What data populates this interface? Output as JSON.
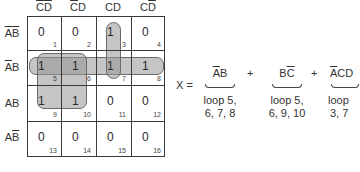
{
  "kmap": {
    "columns": [
      {
        "label": "C̄D̄",
        "overline_parts": [
          "C",
          "D"
        ]
      },
      {
        "label": "C̄D",
        "overline_parts": [
          "C"
        ]
      },
      {
        "label": "CD",
        "overline_parts": []
      },
      {
        "label": "CD̄",
        "overline_parts": [
          "D"
        ]
      }
    ],
    "col_text": [
      {
        "a": "C",
        "b": "D",
        "a_bar": true,
        "b_bar": true
      },
      {
        "a": "C",
        "b": "D",
        "a_bar": true,
        "b_bar": false
      },
      {
        "a": "C",
        "b": "D",
        "a_bar": false,
        "b_bar": false
      },
      {
        "a": "C",
        "b": "D",
        "a_bar": false,
        "b_bar": true
      }
    ],
    "row_text": [
      {
        "a": "A",
        "b": "B",
        "a_bar": true,
        "b_bar": true
      },
      {
        "a": "A",
        "b": "B",
        "a_bar": true,
        "b_bar": false
      },
      {
        "a": "A",
        "b": "B",
        "a_bar": false,
        "b_bar": false
      },
      {
        "a": "A",
        "b": "B",
        "a_bar": false,
        "b_bar": true
      }
    ],
    "cells": [
      [
        {
          "value": "0",
          "index": "1"
        },
        {
          "value": "0",
          "index": "2"
        },
        {
          "value": "1",
          "index": "3"
        },
        {
          "value": "0",
          "index": "4"
        }
      ],
      [
        {
          "value": "1",
          "index": "5"
        },
        {
          "value": "1",
          "index": "6"
        },
        {
          "value": "1",
          "index": "7"
        },
        {
          "value": "1",
          "index": "8"
        }
      ],
      [
        {
          "value": "1",
          "index": "9"
        },
        {
          "value": "1",
          "index": "10"
        },
        {
          "value": "0",
          "index": "11"
        },
        {
          "value": "0",
          "index": "12"
        }
      ],
      [
        {
          "value": "0",
          "index": "13"
        },
        {
          "value": "0",
          "index": "14"
        },
        {
          "value": "0",
          "index": "15"
        },
        {
          "value": "0",
          "index": "16"
        }
      ]
    ],
    "loops": [
      {
        "name": "loop-5-6-7-8",
        "cells": [
          5,
          6,
          7,
          8
        ]
      },
      {
        "name": "loop-5-6-9-10",
        "cells": [
          5,
          6,
          9,
          10
        ]
      },
      {
        "name": "loop-3-7",
        "cells": [
          3,
          7
        ]
      }
    ],
    "loop_color": "#969696"
  },
  "equation": {
    "lhs": "X =",
    "plus": "+",
    "terms": [
      {
        "a": "A",
        "a_bar": true,
        "rest": "B",
        "rest_bar": false,
        "note_line1": "loop 5,",
        "note_line2": "6, 7, 8"
      },
      {
        "a": "B",
        "a_bar": false,
        "rest": "C",
        "rest_bar": true,
        "note_line1": "loop 5,",
        "note_line2": "6, 9, 10"
      },
      {
        "a": "A",
        "a_bar": true,
        "rest": "CD",
        "rest_bar": false,
        "note_line1": "loop",
        "note_line2": "3, 7"
      }
    ]
  }
}
